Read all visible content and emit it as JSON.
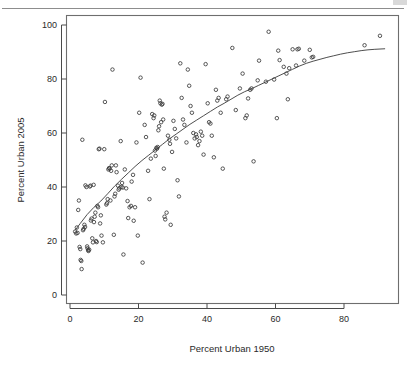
{
  "page": {
    "rule_present": true,
    "corner_mark": ""
  },
  "chart_data": {
    "type": "scatter",
    "title": "",
    "subtitle": "",
    "xlabel": "Percent Urban 1950",
    "ylabel": "Percent Urban 2005",
    "xlim": [
      -1,
      95
    ],
    "ylim": [
      -3,
      103
    ],
    "xticks": [
      0,
      20,
      40,
      60,
      80
    ],
    "yticks": [
      0,
      20,
      40,
      60,
      80,
      100
    ],
    "xtick_labels": [
      "0",
      "20",
      "40",
      "60",
      "80"
    ],
    "ytick_labels": [
      "0",
      "20",
      "40",
      "60",
      "80",
      "100"
    ],
    "grid": false,
    "legend": null,
    "marker": "open-circle",
    "marker_color": "#3a3a3a",
    "points": [
      [
        1.5,
        23.5
      ],
      [
        1.8,
        22.8
      ],
      [
        2.0,
        25.0
      ],
      [
        2.2,
        23.0
      ],
      [
        2.4,
        31.5
      ],
      [
        2.6,
        35.0
      ],
      [
        2.8,
        17.8
      ],
      [
        3.0,
        17.0
      ],
      [
        3.1,
        13.0
      ],
      [
        3.3,
        12.6
      ],
      [
        3.4,
        9.6
      ],
      [
        3.6,
        57.5
      ],
      [
        3.8,
        24.0
      ],
      [
        4.0,
        24.5
      ],
      [
        4.2,
        26.0
      ],
      [
        4.4,
        25.2
      ],
      [
        4.5,
        40.6
      ],
      [
        4.8,
        40.0
      ],
      [
        5.0,
        18.0
      ],
      [
        5.1,
        17.3
      ],
      [
        5.3,
        16.6
      ],
      [
        5.4,
        16.3
      ],
      [
        5.6,
        16.8
      ],
      [
        5.8,
        40.2
      ],
      [
        6.0,
        40.5
      ],
      [
        6.1,
        27.6
      ],
      [
        6.3,
        28.3
      ],
      [
        6.5,
        21.0
      ],
      [
        6.7,
        19.5
      ],
      [
        6.9,
        40.8
      ],
      [
        7.0,
        27.0
      ],
      [
        7.2,
        29.0
      ],
      [
        7.4,
        30.5
      ],
      [
        7.6,
        20.0
      ],
      [
        7.8,
        19.6
      ],
      [
        8.0,
        33.0
      ],
      [
        8.2,
        32.5
      ],
      [
        8.4,
        54.0
      ],
      [
        8.6,
        54.2
      ],
      [
        8.8,
        26.5
      ],
      [
        9.0,
        29.5
      ],
      [
        9.2,
        22.0
      ],
      [
        9.6,
        19.5
      ],
      [
        10.0,
        54.0
      ],
      [
        10.2,
        71.5
      ],
      [
        10.6,
        33.5
      ],
      [
        10.8,
        34.0
      ],
      [
        11.0,
        35.5
      ],
      [
        11.2,
        46.5
      ],
      [
        11.4,
        47.0
      ],
      [
        11.6,
        46.8
      ],
      [
        11.8,
        35.0
      ],
      [
        12.0,
        46.0
      ],
      [
        12.2,
        48.0
      ],
      [
        12.4,
        83.5
      ],
      [
        12.8,
        22.3
      ],
      [
        13.0,
        36.5
      ],
      [
        13.2,
        37.5
      ],
      [
        13.4,
        48.0
      ],
      [
        13.6,
        45.5
      ],
      [
        14.0,
        40.5
      ],
      [
        14.2,
        39.0
      ],
      [
        14.4,
        39.5
      ],
      [
        14.8,
        57.0
      ],
      [
        15.0,
        40.0
      ],
      [
        15.2,
        41.5
      ],
      [
        15.4,
        39.8
      ],
      [
        15.6,
        15.0
      ],
      [
        16.0,
        46.5
      ],
      [
        16.4,
        39.5
      ],
      [
        16.8,
        34.8
      ],
      [
        17.0,
        28.5
      ],
      [
        17.4,
        32.5
      ],
      [
        17.8,
        33.0
      ],
      [
        18.0,
        42.0
      ],
      [
        18.4,
        44.5
      ],
      [
        18.6,
        27.5
      ],
      [
        19.0,
        32.5
      ],
      [
        19.4,
        56.5
      ],
      [
        19.8,
        22.0
      ],
      [
        20.2,
        67.5
      ],
      [
        20.6,
        80.5
      ],
      [
        21.2,
        12.0
      ],
      [
        21.8,
        63.0
      ],
      [
        22.2,
        58.5
      ],
      [
        22.8,
        46.0
      ],
      [
        23.2,
        35.5
      ],
      [
        23.6,
        50.5
      ],
      [
        24.0,
        67.0
      ],
      [
        24.4,
        65.5
      ],
      [
        24.6,
        66.5
      ],
      [
        24.8,
        53.5
      ],
      [
        25.0,
        51.5
      ],
      [
        25.2,
        54.5
      ],
      [
        25.4,
        54.2
      ],
      [
        25.6,
        54.8
      ],
      [
        25.8,
        61.0
      ],
      [
        26.0,
        62.5
      ],
      [
        26.2,
        72.0
      ],
      [
        26.4,
        71.0
      ],
      [
        26.6,
        64.0
      ],
      [
        26.8,
        70.5
      ],
      [
        27.0,
        70.8
      ],
      [
        27.2,
        65.0
      ],
      [
        27.4,
        46.8
      ],
      [
        27.6,
        29.0
      ],
      [
        27.8,
        28.0
      ],
      [
        28.2,
        30.5
      ],
      [
        28.6,
        59.0
      ],
      [
        29.0,
        57.5
      ],
      [
        29.2,
        56.0
      ],
      [
        29.4,
        26.0
      ],
      [
        29.8,
        53.0
      ],
      [
        30.2,
        64.5
      ],
      [
        30.6,
        61.5
      ],
      [
        31.0,
        58.0
      ],
      [
        31.4,
        42.5
      ],
      [
        31.8,
        36.5
      ],
      [
        32.2,
        85.8
      ],
      [
        32.6,
        73.0
      ],
      [
        33.0,
        65.0
      ],
      [
        33.4,
        63.0
      ],
      [
        34.0,
        56.5
      ],
      [
        34.4,
        83.5
      ],
      [
        34.8,
        77.5
      ],
      [
        35.2,
        70.0
      ],
      [
        35.6,
        67.5
      ],
      [
        36.0,
        60.0
      ],
      [
        36.4,
        58.0
      ],
      [
        36.8,
        59.5
      ],
      [
        37.0,
        58.5
      ],
      [
        37.4,
        55.5
      ],
      [
        37.8,
        57.0
      ],
      [
        38.2,
        60.5
      ],
      [
        38.6,
        59.0
      ],
      [
        39.0,
        52.0
      ],
      [
        39.6,
        85.5
      ],
      [
        40.2,
        71.0
      ],
      [
        40.6,
        64.0
      ],
      [
        41.0,
        63.5
      ],
      [
        41.4,
        59.0
      ],
      [
        42.0,
        51.0
      ],
      [
        42.6,
        76.0
      ],
      [
        43.0,
        72.0
      ],
      [
        43.4,
        73.0
      ],
      [
        44.0,
        67.5
      ],
      [
        44.6,
        46.8
      ],
      [
        45.6,
        72.5
      ],
      [
        46.0,
        73.5
      ],
      [
        47.4,
        91.5
      ],
      [
        48.4,
        68.5
      ],
      [
        49.6,
        76.5
      ],
      [
        50.4,
        82.0
      ],
      [
        51.2,
        65.5
      ],
      [
        51.6,
        66.5
      ],
      [
        52.0,
        72.8
      ],
      [
        52.6,
        76.0
      ],
      [
        53.0,
        76.5
      ],
      [
        53.6,
        49.5
      ],
      [
        54.8,
        79.5
      ],
      [
        55.2,
        86.8
      ],
      [
        57.2,
        79.0
      ],
      [
        58.0,
        97.5
      ],
      [
        59.6,
        79.8
      ],
      [
        60.4,
        65.5
      ],
      [
        60.8,
        90.5
      ],
      [
        61.2,
        87.0
      ],
      [
        62.4,
        84.5
      ],
      [
        63.2,
        82.0
      ],
      [
        63.6,
        72.5
      ],
      [
        64.0,
        84.0
      ],
      [
        65.0,
        91.0
      ],
      [
        66.0,
        85.0
      ],
      [
        66.4,
        91.0
      ],
      [
        66.8,
        91.2
      ],
      [
        68.4,
        86.8
      ],
      [
        70.0,
        90.8
      ],
      [
        70.6,
        88.0
      ],
      [
        71.0,
        88.2
      ],
      [
        86.0,
        92.5
      ],
      [
        90.5,
        96.0
      ]
    ],
    "fit": {
      "type": "loess-smoother",
      "color": "#3a3a3a",
      "points": [
        [
          1.5,
          24.0
        ],
        [
          3.0,
          26.5
        ],
        [
          5.0,
          29.8
        ],
        [
          7.0,
          32.5
        ],
        [
          9.0,
          34.8
        ],
        [
          11.0,
          37.5
        ],
        [
          13.0,
          40.3
        ],
        [
          15.0,
          42.8
        ],
        [
          17.0,
          45.2
        ],
        [
          19.0,
          47.6
        ],
        [
          21.0,
          49.8
        ],
        [
          23.0,
          51.8
        ],
        [
          25.0,
          53.8
        ],
        [
          27.0,
          55.8
        ],
        [
          29.0,
          57.8
        ],
        [
          31.0,
          59.6
        ],
        [
          33.0,
          61.4
        ],
        [
          35.0,
          63.2
        ],
        [
          37.0,
          64.8
        ],
        [
          39.0,
          66.4
        ],
        [
          41.0,
          68.0
        ],
        [
          43.0,
          69.6
        ],
        [
          45.0,
          71.0
        ],
        [
          47.0,
          72.5
        ],
        [
          49.0,
          74.0
        ],
        [
          51.0,
          75.3
        ],
        [
          53.0,
          76.4
        ],
        [
          55.0,
          77.6
        ],
        [
          57.0,
          78.8
        ],
        [
          59.0,
          80.0
        ],
        [
          61.0,
          81.2
        ],
        [
          63.0,
          82.4
        ],
        [
          65.0,
          83.6
        ],
        [
          67.0,
          84.8
        ],
        [
          69.0,
          85.8
        ],
        [
          71.0,
          86.6
        ],
        [
          73.0,
          87.3
        ],
        [
          75.0,
          88.0
        ],
        [
          77.0,
          88.6
        ],
        [
          79.0,
          89.2
        ],
        [
          81.0,
          89.7
        ],
        [
          83.0,
          90.1
        ],
        [
          85.0,
          90.5
        ],
        [
          87.0,
          90.8
        ],
        [
          89.0,
          91.0
        ],
        [
          92.0,
          91.2
        ]
      ]
    }
  }
}
